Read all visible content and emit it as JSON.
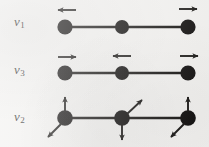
{
  "figure": {
    "background_color": "#f2f1ef",
    "ink_color": "#12100e",
    "width": 209,
    "height": 147
  },
  "modes": [
    {
      "id": "nu1",
      "label_symbol": "ν",
      "label_subscript": "1",
      "label_text": "ν1",
      "description": "symmetric stretch",
      "label_x": 14,
      "label_y": 22,
      "bond_y": 27,
      "atoms": [
        {
          "name": "atom-left",
          "x": 65,
          "y": 27,
          "r": 7.5
        },
        {
          "name": "atom-center",
          "x": 122,
          "y": 27,
          "r": 7.0
        },
        {
          "name": "atom-right",
          "x": 188,
          "y": 27,
          "r": 7.5
        }
      ],
      "arrows": [
        {
          "name": "arrow-left-atom",
          "direction": "left",
          "x1": 76,
          "y1": 10,
          "x2": 57,
          "y2": 10
        },
        {
          "name": "arrow-right-atom",
          "direction": "right",
          "x1": 178,
          "y1": 9,
          "x2": 198,
          "y2": 9
        }
      ]
    },
    {
      "id": "nu3",
      "label_symbol": "ν",
      "label_subscript": "3",
      "label_text": "ν3",
      "description": "asymmetric stretch",
      "label_x": 14,
      "label_y": 71,
      "bond_y": 73,
      "atoms": [
        {
          "name": "atom-left",
          "x": 65,
          "y": 73,
          "r": 7.5
        },
        {
          "name": "atom-center",
          "x": 122,
          "y": 73,
          "r": 7.0
        },
        {
          "name": "atom-right",
          "x": 188,
          "y": 73,
          "r": 7.5
        }
      ],
      "arrows": [
        {
          "name": "arrow-left-atom",
          "direction": "right",
          "x1": 57,
          "y1": 57,
          "x2": 76,
          "y2": 57
        },
        {
          "name": "arrow-center-atom",
          "direction": "left",
          "x1": 131,
          "y1": 56,
          "x2": 112,
          "y2": 56
        },
        {
          "name": "arrow-right-atom",
          "direction": "right",
          "x1": 179,
          "y1": 56,
          "x2": 198,
          "y2": 56
        }
      ]
    },
    {
      "id": "nu2",
      "label_symbol": "ν",
      "label_subscript": "2",
      "label_text": "ν2",
      "description": "bending mode",
      "label_x": 14,
      "label_y": 120,
      "bond_y": 118,
      "atoms": [
        {
          "name": "atom-left",
          "x": 65,
          "y": 118,
          "r": 7.5
        },
        {
          "name": "atom-center",
          "x": 122,
          "y": 118,
          "r": 7.5
        },
        {
          "name": "atom-right",
          "x": 188,
          "y": 118,
          "r": 7.5
        }
      ],
      "arrows": [
        {
          "name": "arrow-left-atom-up",
          "direction": "up",
          "x1": 65,
          "y1": 112,
          "x2": 65,
          "y2": 96
        },
        {
          "name": "arrow-left-atom-down-left",
          "direction": "down-left",
          "x1": 61,
          "y1": 124,
          "x2": 47,
          "y2": 138
        },
        {
          "name": "arrow-center-atom-up-right",
          "direction": "up-right",
          "x1": 127,
          "y1": 114,
          "x2": 143,
          "y2": 99
        },
        {
          "name": "arrow-center-atom-down",
          "direction": "down",
          "x1": 122,
          "y1": 125,
          "x2": 122,
          "y2": 141
        },
        {
          "name": "arrow-right-atom-up",
          "direction": "up",
          "x1": 188,
          "y1": 112,
          "x2": 188,
          "y2": 96
        },
        {
          "name": "arrow-right-atom-down-left",
          "direction": "down-left",
          "x1": 184,
          "y1": 124,
          "x2": 170,
          "y2": 138
        }
      ]
    }
  ]
}
